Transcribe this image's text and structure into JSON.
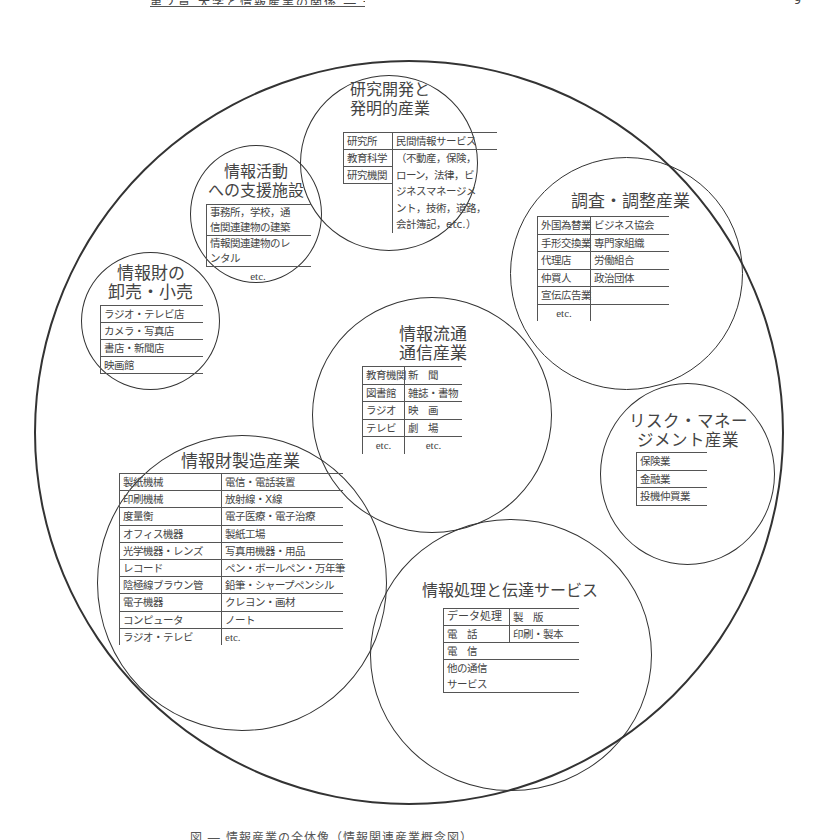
{
  "page": {
    "header_caption": "第２章 大学と情報産業の関係 ― 一覧",
    "page_number": "9",
    "footer_caption": "図 ― 情報産業の全体像（情報関連産業概念図）"
  },
  "diagram": {
    "outer_label": "information-industry",
    "circles": {
      "research": {
        "title": [
          "研究開発と",
          "発明的産業"
        ],
        "left": [
          "研究所",
          "教育科学",
          "研究機関"
        ],
        "right": [
          "民間情報サービス",
          "（不動産，保険，",
          "ローン，法律，ビ",
          "ジネスマネージメ",
          "ント，技術，道路，",
          "会計簿記，etc.）"
        ]
      },
      "support": {
        "title": [
          "情報活動",
          "への支援施設"
        ],
        "rows": [
          [
            "事務所，学校，通",
            "信関連建物の建築"
          ],
          [
            "情報関連建物のレ",
            "ンタル"
          ]
        ],
        "etc": "etc."
      },
      "survey": {
        "title": "調査・調整産業",
        "rows": [
          [
            "外国為替業",
            "ビジネス協会"
          ],
          [
            "手形交換業",
            "専門家組織"
          ],
          [
            "代理店",
            "労働組合"
          ],
          [
            "仲買人",
            "政治団体"
          ],
          [
            "宣伝広告業",
            ""
          ],
          [
            "etc.",
            ""
          ]
        ]
      },
      "retail": {
        "title": [
          "情報財の",
          "卸売・小売"
        ],
        "rows": [
          "ラジオ・テレビ店",
          "カメラ・写真店",
          "書店・新聞店",
          "映画館"
        ]
      },
      "distribution": {
        "title": [
          "情報流通",
          "通信産業"
        ],
        "rows": [
          [
            "教育機関",
            "新　聞"
          ],
          [
            "図書館",
            "雑誌・書物"
          ],
          [
            "ラジオ",
            "映　画"
          ],
          [
            "テレビ",
            "劇　場"
          ],
          [
            "etc.",
            "etc."
          ]
        ]
      },
      "risk": {
        "title": [
          "リスク・マネー",
          "ジメント産業"
        ],
        "rows": [
          "保険業",
          "金融業",
          "投機仲買業"
        ]
      },
      "manufacturing": {
        "title": "情報財製造産業",
        "rows": [
          [
            "製紙機械",
            "電信・電話装置"
          ],
          [
            "印刷機械",
            "放射線・X線"
          ],
          [
            "度量衡",
            "電子医療・電子治療"
          ],
          [
            "オフィス機器",
            "製紙工場"
          ],
          [
            "光学機器・レンズ",
            "写真用機器・用品"
          ],
          [
            "レコード",
            "ペン・ボールペン・万年筆"
          ],
          [
            "陰極線ブラウン管",
            "鉛筆・シャープペンシル"
          ],
          [
            "電子機器",
            "クレヨン・画材"
          ],
          [
            "コンピュータ",
            "ノート"
          ],
          [
            "ラジオ・テレビ",
            "etc."
          ]
        ]
      },
      "processing": {
        "title": "情報処理と伝達サービス",
        "rows": [
          [
            "データ処理",
            "製　版"
          ],
          [
            "電　話",
            "印刷・製本"
          ]
        ],
        "single_rows": [
          "電　信",
          "他の通信",
          "サービス"
        ]
      }
    }
  }
}
